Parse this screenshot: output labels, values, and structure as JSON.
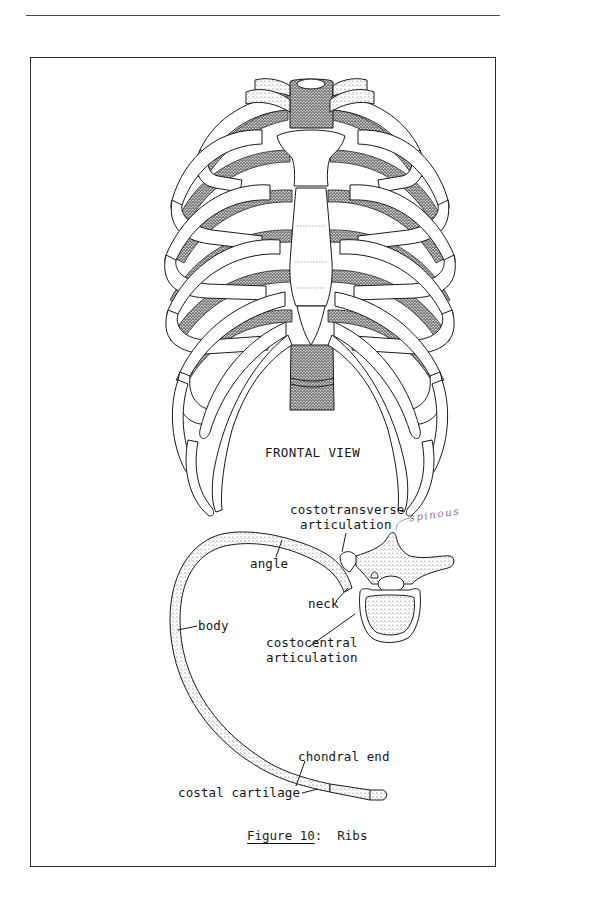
{
  "page": {
    "figure": {
      "caption_label": "Figure 10",
      "caption_sep": ":  ",
      "caption_title": "Ribs"
    },
    "frontal_view": {
      "title": "FRONTAL VIEW"
    },
    "rib_detail": {
      "labels": {
        "costotransverse_line1": "costotransverse",
        "costotransverse_line2": "articulation",
        "angle": "angle",
        "neck": "neck",
        "body": "body",
        "costocentral_line1": "costocentral",
        "costocentral_line2": "articulation",
        "chondral_end": "chondral end",
        "costal_cartilage": "costal cartilage"
      },
      "handwritten_note": "spinous"
    },
    "colors": {
      "ink": "#1a1a1a",
      "stipple": "#6b6b6b",
      "handwriting": "#8a7aa0",
      "paper": "#ffffff"
    }
  }
}
